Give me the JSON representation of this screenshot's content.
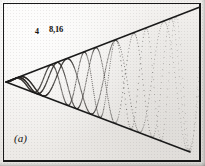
{
  "figure": {
    "panel_label": "(a)",
    "background_color": "#f2f0ee",
    "ink_color": "#1a1a1a",
    "frame": {
      "x": 3,
      "y": 3,
      "width": 198,
      "height": 159,
      "visible": true
    }
  },
  "annotations": [
    {
      "id": "curve-label-4",
      "text": "4",
      "x": 38,
      "y": 33
    },
    {
      "id": "curve-label-8-16",
      "text": "8,16",
      "x": 52,
      "y": 30
    }
  ],
  "chart_data": {
    "type": "line",
    "title": "",
    "subtitle": "",
    "xlabel": "",
    "ylabel": "",
    "grid": false,
    "legend": "inline-labels",
    "axes_visible": false,
    "xlim": [
      0,
      205
    ],
    "ylim": [
      0,
      166
    ],
    "envelope": {
      "vertex": {
        "x": 6,
        "y": 82
      },
      "upper_line": {
        "x1": 6,
        "y1": 82,
        "x2": 200,
        "y2": 7
      },
      "lower_line": {
        "x1": 6,
        "y1": 82,
        "x2": 190,
        "y2": 152
      },
      "style": "solid",
      "color": "#1a1a1a",
      "width": 1.6
    },
    "series": [
      {
        "name": "4",
        "label": "4",
        "style": "dotted",
        "color": "#2a2724",
        "origin": {
          "x": 6,
          "y": 82
        },
        "amplitude_growth": "linear",
        "frequency_growth": "increasing",
        "cycles_visible": 4,
        "first_peak": {
          "x": 30,
          "y": 14
        },
        "first_trough": {
          "x": 72,
          "y": 148
        }
      },
      {
        "name": "8",
        "label": "8,16",
        "style": "dotted",
        "color": "#2a2724",
        "origin": {
          "x": 6,
          "y": 82
        },
        "amplitude_growth": "linear",
        "frequency_growth": "increasing",
        "cycles_visible": 5,
        "first_peak": {
          "x": 38,
          "y": 10
        },
        "first_trough": {
          "x": 78,
          "y": 150
        }
      },
      {
        "name": "16",
        "label": "8,16",
        "style": "dotted",
        "color": "#3a3734",
        "origin": {
          "x": 6,
          "y": 82
        },
        "amplitude_growth": "linear",
        "frequency_growth": "increasing",
        "cycles_visible": 6,
        "first_peak": {
          "x": 41,
          "y": 12
        },
        "first_trough": {
          "x": 81,
          "y": 149
        }
      }
    ]
  }
}
